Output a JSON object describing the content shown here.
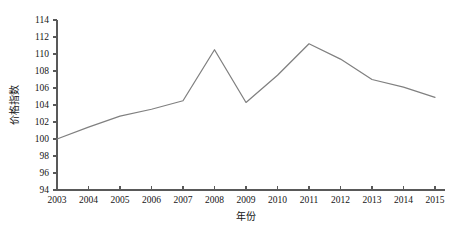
{
  "chart_data": {
    "type": "line",
    "title": "",
    "subtitle": "",
    "xlabel": "年份",
    "ylabel": "价格指数",
    "categories": [
      "2003",
      "2004",
      "2005",
      "2006",
      "2007",
      "2008",
      "2009",
      "2010",
      "2011",
      "2012",
      "2013",
      "2014",
      "2015"
    ],
    "x": [
      2003,
      2004,
      2005,
      2006,
      2007,
      2008,
      2009,
      2010,
      2011,
      2012,
      2013,
      2014,
      2015
    ],
    "values": [
      100.0,
      101.4,
      102.7,
      103.5,
      104.5,
      110.5,
      104.3,
      107.5,
      111.2,
      109.4,
      107.0,
      106.1,
      104.9
    ],
    "series": [
      {
        "name": "价格指数",
        "color": "#808080",
        "values": [
          100.0,
          101.4,
          102.7,
          103.5,
          104.5,
          110.5,
          104.3,
          107.5,
          111.2,
          109.4,
          107.0,
          106.1,
          104.9
        ]
      }
    ],
    "ylim": [
      94,
      114
    ],
    "yticks": [
      94,
      96,
      98,
      100,
      102,
      104,
      106,
      108,
      110,
      112,
      114
    ],
    "ytick_labels": [
      "94",
      "96",
      "98",
      "100",
      "102",
      "104",
      "106",
      "108",
      "110",
      "112",
      "114"
    ],
    "xlim": [
      2003,
      2015
    ],
    "grid": false,
    "legend": false,
    "legend_position": "none",
    "markers": false,
    "annotations": []
  },
  "axes": {
    "y_axis_title": "价格指数",
    "x_axis_title": "年份"
  },
  "style": {
    "line_color": "#808080",
    "axis_color": "#595959",
    "text_color": "#151515",
    "background": "#ffffff"
  }
}
